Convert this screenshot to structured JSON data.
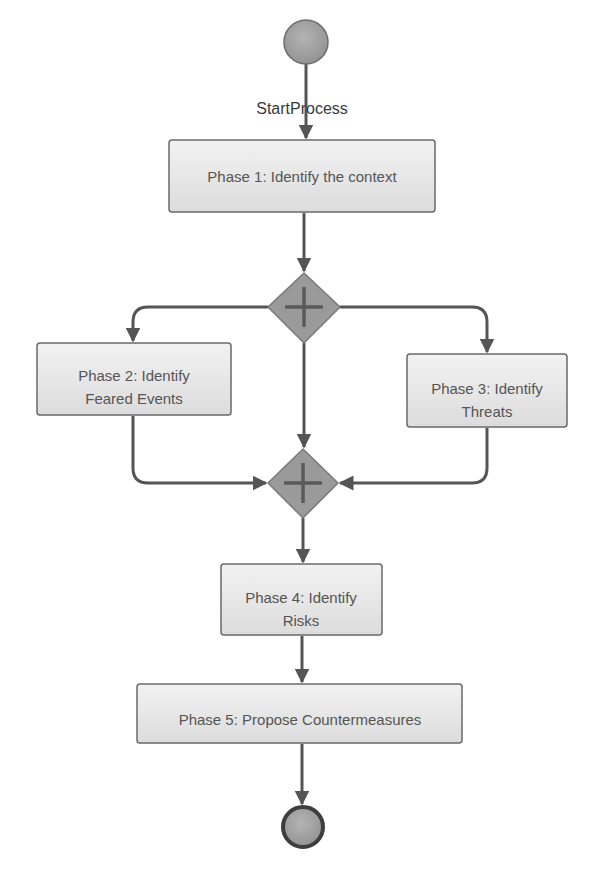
{
  "diagram": {
    "type": "BPMN process flow",
    "start_event": {
      "label": "StartProcess"
    },
    "tasks": [
      {
        "id": "p1",
        "lines": [
          "Phase 1: Identify the context"
        ]
      },
      {
        "id": "p2",
        "lines": [
          "Phase 2: Identify",
          "Feared Events"
        ]
      },
      {
        "id": "p3",
        "lines": [
          "Phase 3: Identify",
          "Threats"
        ]
      },
      {
        "id": "p4",
        "lines": [
          "Phase 4: Identify",
          "Risks"
        ]
      },
      {
        "id": "p5",
        "lines": [
          "Phase 5: Propose Countermeasures"
        ]
      }
    ],
    "gateways": [
      {
        "id": "split",
        "kind": "parallel",
        "symbol": "plus-icon"
      },
      {
        "id": "join",
        "kind": "parallel",
        "symbol": "plus-icon"
      }
    ],
    "end_event": {
      "label": ""
    },
    "flows": [
      [
        "start",
        "p1"
      ],
      [
        "p1",
        "split"
      ],
      [
        "split",
        "p2"
      ],
      [
        "split",
        "p3"
      ],
      [
        "split",
        "join"
      ],
      [
        "p2",
        "join"
      ],
      [
        "p3",
        "join"
      ],
      [
        "join",
        "p4"
      ],
      [
        "p4",
        "p5"
      ],
      [
        "p5",
        "end"
      ]
    ],
    "colors": {
      "event_fill": "#a8a8a8",
      "gateway_fill": "#9a9a9a",
      "task_fill_top": "#f4f4f4",
      "task_fill_bottom": "#dedede",
      "edge": "#555555",
      "text": "#555555"
    }
  }
}
